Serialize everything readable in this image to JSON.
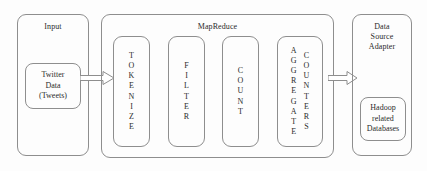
{
  "diagram": {
    "background_color": "#fdfdfd",
    "line_color": "#8e8e8e",
    "text_color": "#2b2b2b"
  },
  "input_panel": {
    "label": "Input",
    "source_box": {
      "label": "Twitter\nData\n(Tweets)"
    }
  },
  "mapreduce_panel": {
    "label": "MapReduce",
    "stages": [
      {
        "name": "tokenize",
        "columns": [
          {
            "letters": [
              "T",
              "O",
              "K",
              "E",
              "N",
              "I",
              "Z",
              "E"
            ]
          }
        ]
      },
      {
        "name": "filter",
        "columns": [
          {
            "letters": [
              "F",
              "I",
              "L",
              "T",
              "E",
              "R"
            ]
          }
        ]
      },
      {
        "name": "count",
        "columns": [
          {
            "letters": [
              "C",
              "O",
              "U",
              "N",
              "T"
            ]
          }
        ]
      },
      {
        "name": "aggregate-counters",
        "columns": [
          {
            "letters": [
              "A",
              "G",
              "G",
              "R",
              "E",
              "G",
              "A",
              "T",
              "E"
            ]
          },
          {
            "letters": [
              "C",
              "O",
              "U",
              "N",
              "T",
              "E",
              "R",
              "S"
            ]
          }
        ]
      }
    ]
  },
  "output_panel": {
    "label": "Data\nSource\nAdapter",
    "database_box": {
      "label": "Hadoop\nrelated\nDatabases"
    }
  },
  "arrows": [
    {
      "name": "input-to-mapreduce",
      "direction": "right"
    },
    {
      "name": "mapreduce-to-adapter",
      "direction": "right"
    }
  ]
}
